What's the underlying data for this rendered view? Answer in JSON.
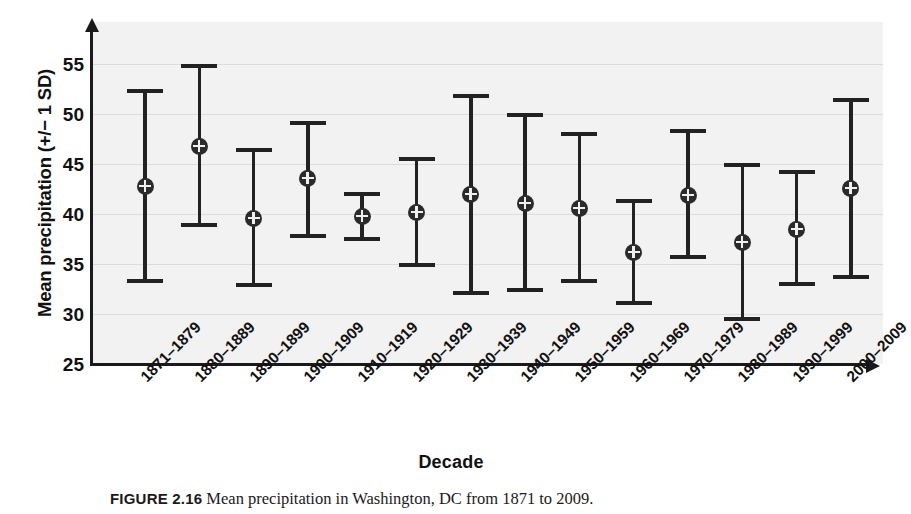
{
  "figure": {
    "caption_label": "FIGURE 2.16",
    "caption_text": "Mean precipitation in Washington, DC from 1871 to 2009."
  },
  "axes": {
    "ylabel": "Mean precipitation (+/− 1 SD)",
    "xlabel": "Decade",
    "yticks": [
      "55",
      "50",
      "45",
      "40",
      "35",
      "30",
      "25"
    ],
    "ylim": [
      25,
      55
    ],
    "grid": true
  },
  "chart_data": {
    "type": "scatter",
    "title": "",
    "xlabel": "Decade",
    "ylabel": "Mean precipitation (+/- 1 SD)",
    "ylim": [
      25,
      55
    ],
    "ytick_values": [
      25,
      30,
      35,
      40,
      45,
      50,
      55
    ],
    "grid": true,
    "legend": "none",
    "error_type": "+/- 1 SD",
    "categories": [
      "1871–1879",
      "1880–1889",
      "1890–1899",
      "1900–1909",
      "1910–1919",
      "1920–1929",
      "1930–1939",
      "1940–1949",
      "1950–1959",
      "1960–1969",
      "1970–1979",
      "1980–1989",
      "1990–1999",
      "2000–2009"
    ],
    "series": [
      {
        "name": "Mean precipitation",
        "values": [
          42.8,
          46.8,
          39.6,
          43.6,
          39.8,
          40.2,
          42.0,
          41.1,
          40.6,
          36.2,
          41.9,
          37.2,
          38.5,
          42.6
        ],
        "upper": [
          52.4,
          54.9,
          46.5,
          49.2,
          42.1,
          45.6,
          51.9,
          50.0,
          48.1,
          41.4,
          48.4,
          45.0,
          44.3,
          51.5
        ],
        "lower": [
          33.2,
          38.8,
          32.8,
          37.7,
          37.4,
          34.8,
          32.0,
          32.3,
          33.2,
          31.0,
          35.6,
          29.4,
          32.9,
          33.6
        ]
      }
    ]
  },
  "colors": {
    "plot_background": "#f2f2f2",
    "gridline": "#dcdcdc",
    "marker": "#2b2b2b",
    "axis": "#1a1a1a"
  }
}
